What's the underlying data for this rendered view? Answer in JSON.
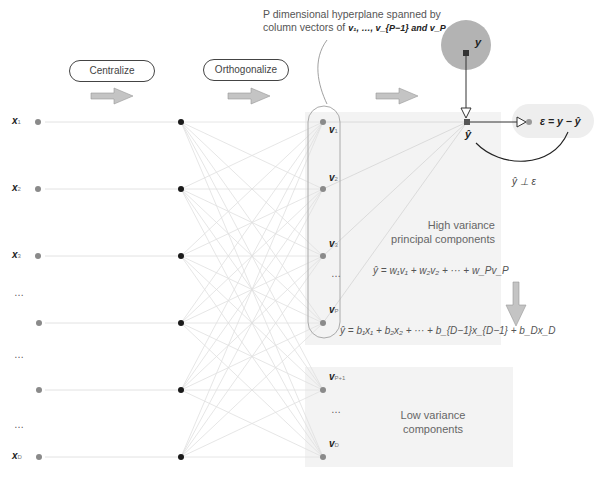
{
  "header": {
    "hyperplane_note_line1": "P dimensional hyperplane spanned by",
    "hyperplane_note_line2_prefix": "column vectors of ",
    "hyperplane_note_vectors": "v₁, …, v_{P−1} and v_P"
  },
  "steps": [
    {
      "label": "Centralize"
    },
    {
      "label": "Orthogonalize"
    }
  ],
  "inputs": [
    {
      "label": "x",
      "sub": "1"
    },
    {
      "label": "x",
      "sub": "2"
    },
    {
      "label": "x",
      "sub": "3"
    },
    {
      "label": "…",
      "sub": ""
    },
    {
      "label": "…",
      "sub": ""
    },
    {
      "label": "…",
      "sub": ""
    },
    {
      "label": "x",
      "sub": "D"
    }
  ],
  "components": [
    {
      "label": "v",
      "sub": "1"
    },
    {
      "label": "v",
      "sub": "2"
    },
    {
      "label": "v",
      "sub": "3"
    },
    {
      "label": "…",
      "sub": ""
    },
    {
      "label": "v",
      "sub": "P"
    },
    {
      "label": "v",
      "sub": "P+1"
    },
    {
      "label": "…",
      "sub": ""
    },
    {
      "label": "v",
      "sub": "D"
    }
  ],
  "target": {
    "y_label": "y",
    "yhat_label": "ŷ"
  },
  "residual": {
    "eq": "ε = y − ŷ",
    "orth": "ŷ ⊥ ε"
  },
  "regions": {
    "high_line1": "High variance",
    "high_line2": "principal components",
    "low_line1": "Low variance",
    "low_line2": "components"
  },
  "equations": {
    "pc_regression": "ŷ = w₁v₁ + w₂v₂ + ··· + w_Pv_P",
    "x_regression": "ŷ = b₁x₁ + b₂x₂ + ··· + b_{D−1}x_{D−1} + b_Dx_D"
  },
  "colors": {
    "shade": "#f2f2f2",
    "node_gray": "#8a8a8a",
    "node_black": "#1a1a1a",
    "arrow_fill": "#c4c4c4",
    "circle_fill": "#b3b3b3",
    "line": "#dcdcdc"
  }
}
